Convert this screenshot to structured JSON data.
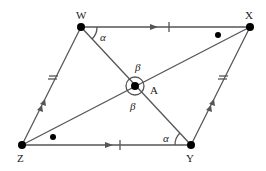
{
  "diagram": {
    "type": "parallelogram with diagonals",
    "points": {
      "W": {
        "label": "W",
        "x": 81,
        "y": 27
      },
      "X": {
        "label": "X",
        "x": 250,
        "y": 27
      },
      "Y": {
        "label": "Y",
        "x": 191,
        "y": 145
      },
      "Z": {
        "label": "Z",
        "x": 22,
        "y": 145
      },
      "A": {
        "label": "A",
        "x": 135,
        "y": 86
      }
    },
    "angles": {
      "alpha_w": "α",
      "alpha_y": "α",
      "beta_top": "β",
      "beta_bottom": "β"
    },
    "edges": [
      "WX",
      "XY",
      "YZ",
      "ZW",
      "WY",
      "ZX"
    ],
    "line_color": "#555555",
    "point_color": "#000000"
  }
}
